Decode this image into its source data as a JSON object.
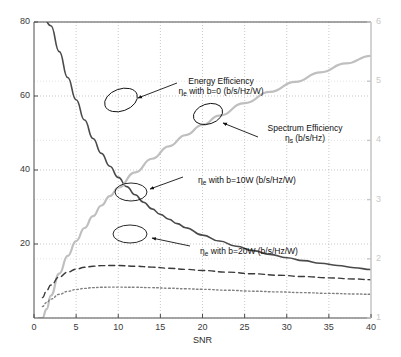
{
  "chart_data": {
    "type": "line",
    "title": "",
    "xlabel": "SNR",
    "ylabel": "",
    "xlim": [
      0,
      40
    ],
    "ylim": [
      0,
      80
    ],
    "y2lim": [
      1,
      6
    ],
    "grid": true,
    "legend_position": "none",
    "x_ticks": [
      "0",
      "5",
      "10",
      "15",
      "20",
      "25",
      "30",
      "35",
      "40"
    ],
    "x_tick_values": [
      0,
      5,
      10,
      15,
      20,
      25,
      30,
      35,
      40
    ],
    "y_ticks": [
      "20",
      "40",
      "60",
      "80"
    ],
    "y_tick_values": [
      20,
      40,
      60,
      80
    ],
    "y2_ticks": [
      "1",
      "2",
      "3",
      "4",
      "5",
      "6"
    ],
    "y2_tick_values": [
      1,
      2,
      3,
      4,
      5,
      6
    ],
    "series": [
      {
        "name": "Energy Efficiency, b=0 (b/s/Hz/W)",
        "axis": "left",
        "style": "solid",
        "color": "#4a4a4a",
        "width": 1.6,
        "x": [
          1,
          2,
          3,
          4,
          5,
          6,
          7,
          8,
          9,
          10,
          11,
          12,
          13,
          14,
          15,
          16,
          17,
          18,
          20,
          22,
          24,
          26,
          28,
          30,
          32,
          34,
          36,
          38,
          40
        ],
        "y": [
          82,
          79,
          72,
          65,
          59,
          53.5,
          48.5,
          44.5,
          41,
          38,
          35.5,
          33.3,
          31.3,
          29.5,
          28,
          26.7,
          25.5,
          24.4,
          22.4,
          20.8,
          19.4,
          18.2,
          17.2,
          16.3,
          15.5,
          14.8,
          14.2,
          13.6,
          13.1
        ]
      },
      {
        "name": "Spectrum Efficiency ηs (b/s/Hz)",
        "axis": "right",
        "style": "solid",
        "color": "#bfbfbf",
        "width": 2.2,
        "x": [
          0.6,
          1,
          1.5,
          2,
          3,
          4,
          5,
          6,
          7,
          8,
          9,
          10,
          12,
          14,
          16,
          18,
          20,
          22,
          25,
          28,
          31,
          34,
          37,
          40
        ],
        "y": [
          0.62,
          0.88,
          1.15,
          1.38,
          1.75,
          2.05,
          2.3,
          2.52,
          2.72,
          2.9,
          3.06,
          3.2,
          3.46,
          3.69,
          3.9,
          4.09,
          4.26,
          4.42,
          4.63,
          4.82,
          4.99,
          5.15,
          5.3,
          5.43
        ]
      },
      {
        "name": "ηe with b=10W (b/s/Hz/W)",
        "axis": "left",
        "style": "dashed",
        "color": "#3a3a3a",
        "width": 1.4,
        "x": [
          1,
          1.5,
          2,
          3,
          4,
          5,
          6,
          7,
          8,
          9,
          10,
          12,
          14,
          16,
          18,
          20,
          23,
          26,
          29,
          32,
          35,
          38,
          40
        ],
        "y": [
          5.5,
          7.4,
          8.9,
          11.1,
          12.4,
          13.2,
          13.7,
          14.0,
          14.15,
          14.2,
          14.2,
          14.0,
          13.75,
          13.45,
          13.15,
          12.85,
          12.4,
          11.95,
          11.55,
          11.2,
          10.85,
          10.55,
          10.35
        ]
      },
      {
        "name": "ηe with b=20W (b/s/Hz/W)",
        "axis": "left",
        "style": "dotted",
        "color": "#808080",
        "width": 1.4,
        "x": [
          1,
          1.5,
          2,
          3,
          4,
          5,
          6,
          7,
          8,
          9,
          10,
          12,
          14,
          16,
          18,
          20,
          23,
          26,
          29,
          32,
          35,
          38,
          40
        ],
        "y": [
          3.1,
          4.2,
          5.1,
          6.4,
          7.2,
          7.7,
          8.0,
          8.2,
          8.3,
          8.35,
          8.35,
          8.3,
          8.2,
          8.05,
          7.9,
          7.75,
          7.5,
          7.25,
          7.05,
          6.85,
          6.65,
          6.5,
          6.4
        ]
      }
    ],
    "annotations": [
      {
        "id": "energy-efficiency-b0",
        "line1": "Energy Efficiency",
        "line2_pre": "η",
        "line2_sub": "e",
        "line2_post": " with b=0 (b/s/Hz/W)",
        "text_x": 221,
        "text_y": 76,
        "ellipse_cx": 121,
        "ellipse_cy": 100,
        "ellipse_rx": 17,
        "ellipse_ry": 11,
        "ellipse_rot": -20,
        "arrow_x1": 177,
        "arrow_y1": 83,
        "arrow_x2": 138,
        "arrow_y2": 98
      },
      {
        "id": "spectrum-efficiency",
        "line1": "Spectrum Efficiency",
        "line2_pre": "η",
        "line2_sub": "s",
        "line2_post": " (b/s/Hz)",
        "text_x": 305,
        "text_y": 123,
        "ellipse_cx": 208,
        "ellipse_cy": 114,
        "ellipse_rx": 15,
        "ellipse_ry": 10,
        "ellipse_rot": -18,
        "arrow_x1": 258,
        "arrow_y1": 137,
        "arrow_x2": 223,
        "arrow_y2": 123
      },
      {
        "id": "eta-e-b10w",
        "line1": "",
        "line2_pre": "η",
        "line2_sub": "e",
        "line2_post": " with b=10W (b/s/Hz/W)",
        "text_x": 247,
        "text_y": 175,
        "ellipse_cx": 131,
        "ellipse_cy": 192,
        "ellipse_rx": 16,
        "ellipse_ry": 9,
        "ellipse_rot": 0,
        "arrow_x1": 183,
        "arrow_y1": 177,
        "arrow_x2": 150,
        "arrow_y2": 189
      },
      {
        "id": "eta-e-b20w",
        "line1": "",
        "line2_pre": "η",
        "line2_sub": "e",
        "line2_post": " with b=20W (b/s/Hz/W)",
        "text_x": 249,
        "text_y": 246,
        "ellipse_cx": 130,
        "ellipse_cy": 234,
        "ellipse_rx": 17,
        "ellipse_ry": 9,
        "ellipse_rot": 0,
        "arrow_x1": 190,
        "arrow_y1": 246,
        "arrow_x2": 152,
        "arrow_y2": 238
      }
    ]
  },
  "colors": {
    "axis": "#4d4d4d",
    "right_axis": "#c8c8c8",
    "grid": "#b0b0b0",
    "background": "#ffffff"
  }
}
